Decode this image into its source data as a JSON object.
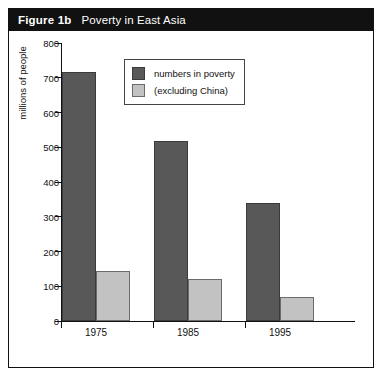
{
  "header": {
    "figure_number": "Figure 1b",
    "title": "Poverty in East Asia"
  },
  "chart_data": {
    "type": "bar",
    "title": "Poverty in East Asia",
    "xlabel": "",
    "ylabel": "millions of people",
    "categories": [
      "1975",
      "1985",
      "1995"
    ],
    "yticks": [
      "800",
      "700",
      "600",
      "500",
      "400",
      "300",
      "200",
      "100",
      "0"
    ],
    "ylim": [
      0,
      800
    ],
    "grid": false,
    "legend_position": "top-center",
    "series": [
      {
        "name": "numbers in poverty",
        "color": "#585858",
        "values": [
          717,
          518,
          340
        ]
      },
      {
        "name": "(excluding China)",
        "color": "#c2c2c2",
        "values": [
          145,
          120,
          68
        ]
      }
    ]
  }
}
